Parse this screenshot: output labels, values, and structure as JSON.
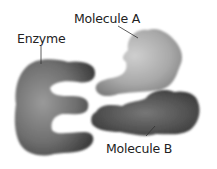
{
  "labels": {
    "enzyme": "Enzyme",
    "molecule_a": "Molecule A",
    "molecule_b": "Molecule B"
  },
  "colors": {
    "enzyme": "#6a6a6a",
    "molecule_a": "#a8a8a8",
    "molecule_b": "#4e4e4e",
    "background": "#ffffff"
  }
}
